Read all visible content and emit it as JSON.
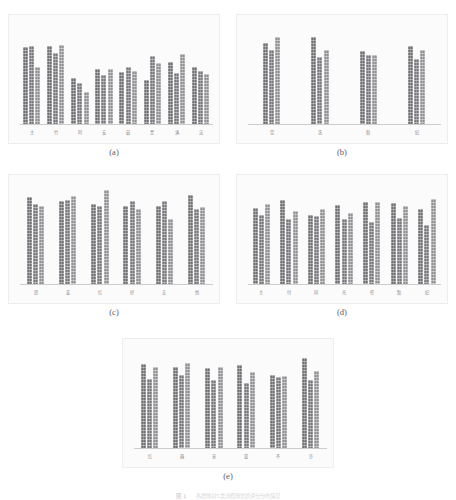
{
  "figure": {
    "header_note": "",
    "caption_label": "图 1",
    "caption_text": "各群体对5类消费场景的评分分布情况",
    "panels": [
      {
        "id": "a",
        "caption": "(a)",
        "categories": [
          "主",
          "竹",
          "阿",
          "安",
          "菇",
          "至",
          "满",
          "法"
        ],
        "series": [
          {
            "name": "系列1",
            "values": [
              78,
              79,
              46,
              56,
              53,
              44,
              63,
              58
            ]
          },
          {
            "name": "系列2",
            "values": [
              79,
              72,
              41,
              50,
              58,
              69,
              52,
              54
            ]
          },
          {
            "name": "系列3",
            "values": [
              58,
              80,
              32,
              56,
              54,
              62,
              71,
              51
            ]
          }
        ]
      },
      {
        "id": "b",
        "caption": "(b)",
        "categories": [
          "党",
          "洗",
          "取",
          "纪"
        ],
        "series": [
          {
            "name": "系列1",
            "values": [
              82,
              88,
              74,
              79
            ]
          },
          {
            "name": "系列2",
            "values": [
              75,
              68,
              70,
              66
            ]
          },
          {
            "name": "系列3",
            "values": [
              88,
              75,
              70,
              75
            ]
          }
        ]
      },
      {
        "id": "c",
        "caption": "(c)",
        "categories": [
          "怨",
          "董",
          "红",
          "好",
          "夫",
          "悦"
        ],
        "series": [
          {
            "name": "系列1",
            "values": [
              88,
              84,
              81,
              79,
              79,
              90
            ]
          },
          {
            "name": "系列2",
            "values": [
              81,
              85,
              79,
              84,
              84,
              76
            ]
          },
          {
            "name": "系列3",
            "values": [
              79,
              89,
              95,
              76,
              66,
              78
            ]
          }
        ]
      },
      {
        "id": "d",
        "caption": "(d)",
        "categories": [
          "主",
          "付",
          "同",
          "光",
          "任",
          "點",
          "纪"
        ],
        "series": [
          {
            "name": "系列1",
            "values": [
              77,
              85,
              70,
              80,
              83,
              82,
              76
            ]
          },
          {
            "name": "系列2",
            "values": [
              70,
              66,
              69,
              66,
              63,
              67,
              60
            ]
          },
          {
            "name": "系列3",
            "values": [
              81,
              74,
              76,
              72,
              83,
              79,
              86
            ]
          }
        ]
      },
      {
        "id": "e",
        "caption": "(e)",
        "categories": [
          "红",
          "器",
          "来",
          "量",
          "不",
          "许"
        ],
        "series": [
          {
            "name": "系列1",
            "values": [
              85,
              82,
              81,
              84,
              74,
              91
            ]
          },
          {
            "name": "系列2",
            "values": [
              70,
              74,
              69,
              66,
              72,
              69
            ]
          },
          {
            "name": "系列3",
            "values": [
              82,
              86,
              82,
              77,
              73,
              78
            ]
          }
        ]
      }
    ]
  },
  "chart_data": [
    {
      "type": "bar",
      "title": "(a)",
      "categories": [
        "主",
        "竹",
        "阿",
        "安",
        "菇",
        "至",
        "满",
        "法"
      ],
      "series": [
        {
          "name": "系列1",
          "values": [
            78,
            79,
            46,
            56,
            53,
            44,
            63,
            58
          ]
        },
        {
          "name": "系列2",
          "values": [
            79,
            72,
            41,
            50,
            58,
            69,
            52,
            54
          ]
        },
        {
          "name": "系列3",
          "values": [
            58,
            80,
            32,
            56,
            54,
            62,
            71,
            51
          ]
        }
      ],
      "xlabel": "",
      "ylabel": "",
      "ylim": [
        0,
        100
      ],
      "grid": false,
      "legend": "none"
    },
    {
      "type": "bar",
      "title": "(b)",
      "categories": [
        "党",
        "洗",
        "取",
        "纪"
      ],
      "series": [
        {
          "name": "系列1",
          "values": [
            82,
            88,
            74,
            79
          ]
        },
        {
          "name": "系列2",
          "values": [
            75,
            68,
            70,
            66
          ]
        },
        {
          "name": "系列3",
          "values": [
            88,
            75,
            70,
            75
          ]
        }
      ],
      "xlabel": "",
      "ylabel": "",
      "ylim": [
        0,
        100
      ],
      "grid": false,
      "legend": "none"
    },
    {
      "type": "bar",
      "title": "(c)",
      "categories": [
        "怨",
        "董",
        "红",
        "好",
        "夫",
        "悦"
      ],
      "series": [
        {
          "name": "系列1",
          "values": [
            88,
            84,
            81,
            79,
            79,
            90
          ]
        },
        {
          "name": "系列2",
          "values": [
            81,
            85,
            79,
            84,
            84,
            76
          ]
        },
        {
          "name": "系列3",
          "values": [
            79,
            89,
            95,
            76,
            66,
            78
          ]
        }
      ],
      "xlabel": "",
      "ylabel": "",
      "ylim": [
        0,
        100
      ],
      "grid": false,
      "legend": "none"
    },
    {
      "type": "bar",
      "title": "(d)",
      "categories": [
        "主",
        "付",
        "同",
        "光",
        "任",
        "點",
        "纪"
      ],
      "series": [
        {
          "name": "系列1",
          "values": [
            77,
            85,
            70,
            80,
            83,
            82,
            76
          ]
        },
        {
          "name": "系列2",
          "values": [
            70,
            66,
            69,
            66,
            63,
            67,
            60
          ]
        },
        {
          "name": "系列3",
          "values": [
            81,
            74,
            76,
            72,
            83,
            79,
            86
          ]
        }
      ],
      "xlabel": "",
      "ylabel": "",
      "ylim": [
        0,
        100
      ],
      "grid": false,
      "legend": "none"
    },
    {
      "type": "bar",
      "title": "(e)",
      "categories": [
        "红",
        "器",
        "来",
        "量",
        "不",
        "许"
      ],
      "series": [
        {
          "name": "系列1",
          "values": [
            85,
            82,
            81,
            84,
            74,
            91
          ]
        },
        {
          "name": "系列2",
          "values": [
            70,
            74,
            69,
            66,
            72,
            69
          ]
        },
        {
          "name": "系列3",
          "values": [
            82,
            86,
            82,
            77,
            73,
            78
          ]
        }
      ],
      "xlabel": "",
      "ylabel": "",
      "ylim": [
        0,
        100
      ],
      "grid": false,
      "legend": "none"
    }
  ],
  "colors": {
    "series1": "#85858a",
    "series2": "#8e8e93",
    "series3": "#aaaaae",
    "panel_bg": "#fbfbfb",
    "panel_border": "#ededee",
    "axis": "#cdcdce",
    "text": "#5a5b5f"
  }
}
